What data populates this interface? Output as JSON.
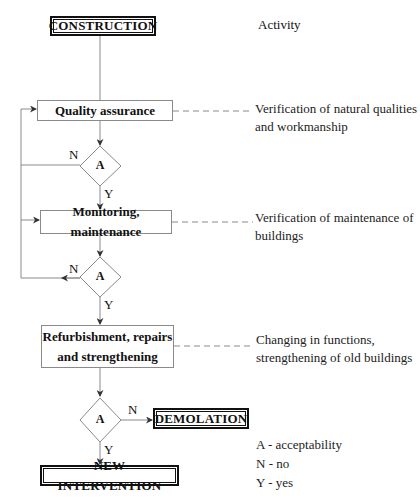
{
  "header": {
    "start": "CONSTRUCTION",
    "column_title": "Activity"
  },
  "steps": [
    {
      "label": "Quality assurance",
      "description_line1": "Verification of natural qualities",
      "description_line2": "and workmanship"
    },
    {
      "label": "Monitoring, maintenance",
      "description_line1": "Verification of maintenance of",
      "description_line2": "buildings"
    },
    {
      "label_line1": "Refurbishment, repairs",
      "label_line2": "and strengthening",
      "description_line1": "Changing in functions,",
      "description_line2": "strengthening of old buildings"
    }
  ],
  "decisions": [
    {
      "label": "A",
      "no": "N",
      "yes": "Y"
    },
    {
      "label": "A",
      "no": "N",
      "yes": "Y"
    },
    {
      "label": "A",
      "no": "N",
      "yes": "Y"
    }
  ],
  "outcomes": {
    "no": "DEMOLATION",
    "yes": "NEW INTERVENTION"
  },
  "legend": {
    "a": "A - acceptability",
    "n": "N - no",
    "y": "Y - yes"
  },
  "colors": {
    "line": "#8a8a8a",
    "thick_border": "#111111",
    "text": "#111111"
  }
}
